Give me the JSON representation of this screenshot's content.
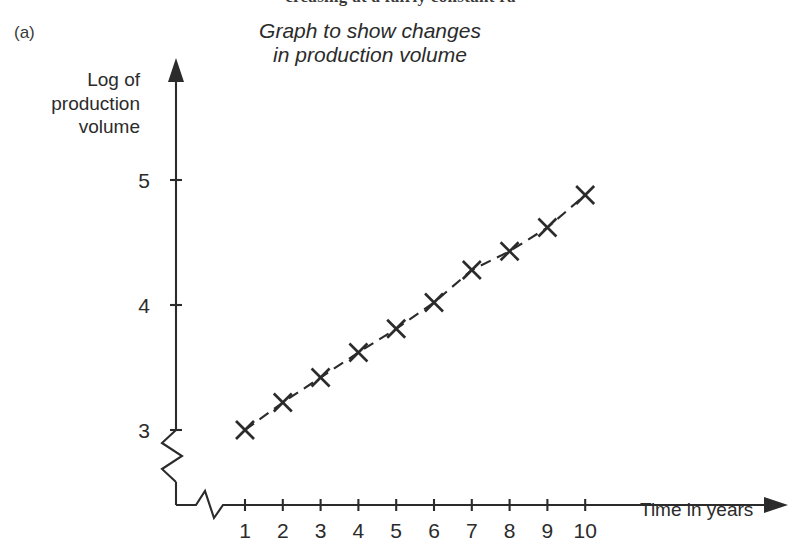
{
  "page": {
    "cutoff_text": "creasing at a fairly constant ra",
    "part_label": "(a)"
  },
  "chart_data": {
    "type": "line",
    "title": "Graph to show changes in production volume",
    "title_line1": "Graph to show changes",
    "title_line2": "in production volume",
    "xlabel": "Time in years",
    "ylabel": "Log of production volume",
    "ylabel_line1": "Log of",
    "ylabel_line2": "production",
    "ylabel_line3": "volume",
    "x": [
      1,
      2,
      3,
      4,
      5,
      6,
      7,
      8,
      9,
      10
    ],
    "values": [
      3.0,
      3.22,
      3.42,
      3.62,
      3.81,
      4.02,
      4.28,
      4.43,
      4.62,
      4.88
    ],
    "xticks": [
      "1",
      "2",
      "3",
      "4",
      "5",
      "6",
      "7",
      "8",
      "9",
      "10"
    ],
    "yticks": [
      "3",
      "4",
      "5"
    ],
    "ytick_values": [
      3,
      4,
      5
    ],
    "xlim": [
      0,
      10.5
    ],
    "ylim": [
      2.85,
      5.2
    ],
    "grid": false,
    "legend": false,
    "marker": "cross",
    "line_style": "dashed",
    "axis_break_x": true,
    "axis_break_y": true,
    "line_color": "#2b2b2b",
    "axis_color": "#2b2b2b",
    "background_color": "#ffffff"
  }
}
